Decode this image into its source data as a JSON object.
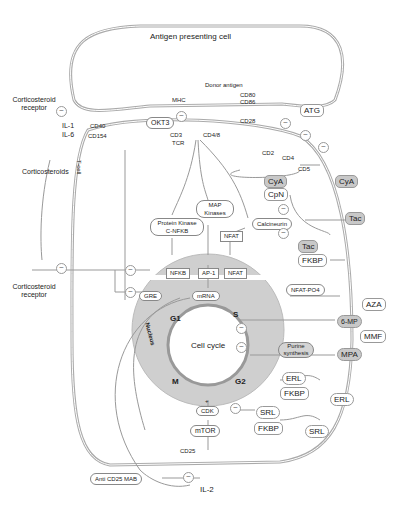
{
  "diagram": {
    "apc_label": "Antigen presenting cell",
    "tcell_label": "T-cell",
    "nucleus_label": "Nucleus",
    "cell_cycle_label": "Cell cycle",
    "phases": {
      "g1": "G1",
      "s": "S",
      "g2": "G2",
      "m": "M"
    },
    "inhibit_symbol": "⊖",
    "plus_symbol": "+",
    "surface": {
      "corticosteroid_receptor_top": "Corticosteroid receptor",
      "il1": "IL-1",
      "il6": "IL-6",
      "corticosteroids": "Corticosteroids",
      "cd40": "CD40",
      "cd154": "CD154",
      "mhc": "MHC",
      "donor_antigen": "Donor antigen",
      "cd80": "CD80",
      "cd86": "CD86",
      "cd28": "CD28",
      "okt3": "OKT3",
      "cd3": "CD3",
      "tcr": "TCR",
      "cd48": "CD4/8",
      "cd2": "CD2",
      "cd4": "CD4",
      "cd5": "CD5",
      "atg": "ATG",
      "corticosteroid_receptor_bottom": "Corticosteroid receptor"
    },
    "signaling": {
      "map_kinases": "MAP Kinases",
      "protein_kinase": "Protein Kinase C-NFKB",
      "calcineurin": "Calcineurin",
      "nfat_cyto": "NFAT",
      "nfat_po4": "NFAT-PO4",
      "nfkb": "NFKB",
      "ap1": "AP-1",
      "nfat_nuc": "NFAT",
      "gre": "GRE",
      "mrna": "mRNA",
      "cdk": "CDK",
      "mtor": "mTOR",
      "cd25": "CD25",
      "il2": "IL-2",
      "purine_synthesis": "Purine synthesis"
    },
    "drugs": {
      "cya_in": "CyA",
      "cpn": "CpN",
      "cya_out": "CyA",
      "tac_out": "Tac",
      "tac_in": "Tac",
      "fkbp_tac": "FKBP",
      "aza": "AZA",
      "six_mp": "6-MP",
      "mmf": "MMF",
      "mpa": "MPA",
      "erl_in": "ERL",
      "fkbp_erl": "FKBP",
      "erl_out": "ERL",
      "srl_in": "SRL",
      "fkbp_srl": "FKBP",
      "srl_out": "SRL",
      "anti_cd25": "Anti CD25 MAB"
    }
  }
}
